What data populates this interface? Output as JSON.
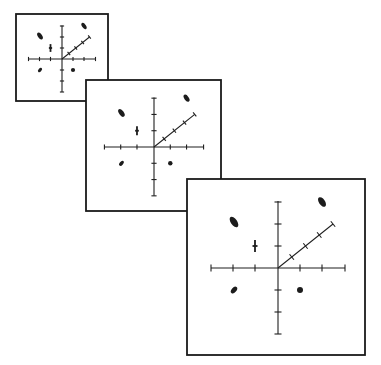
{
  "figure": {
    "colors": {
      "ink": "#1c1c1c",
      "background": "#ffffff",
      "panel_fill": "#ffffff"
    }
  },
  "panels": [
    {
      "name": "small",
      "frame": {
        "x": 16,
        "y": 14,
        "w": 92,
        "h": 87
      },
      "origin": {
        "x": 62,
        "y": 59
      },
      "scale": 0.5,
      "label": "Small panel"
    },
    {
      "name": "medium",
      "frame": {
        "x": 86,
        "y": 80,
        "w": 135,
        "h": 131
      },
      "origin": {
        "x": 154,
        "y": 147
      },
      "scale": 0.74,
      "label": "Medium panel"
    },
    {
      "name": "large",
      "frame": {
        "x": 187,
        "y": 179,
        "w": 178,
        "h": 176
      },
      "origin": {
        "x": 278,
        "y": 268
      },
      "scale": 1.0,
      "label": "Large panel"
    }
  ],
  "axes_template": {
    "horizontal": {
      "min": -67,
      "max": 67,
      "ticks": [
        -67,
        -45,
        -23,
        22,
        44,
        67
      ]
    },
    "vertical": {
      "min": -67,
      "max": 66,
      "ticks": [
        -66,
        -44,
        -22,
        22,
        44,
        66
      ]
    },
    "diagonal": {
      "end": {
        "x": 55,
        "y": -44
      },
      "ticks": [
        0.25,
        0.5,
        0.75,
        1.0
      ]
    },
    "tick_half_length": 3.5
  },
  "markers_template": [
    {
      "type": "ellipse",
      "name": "upper-left-ellipse",
      "cx": -44,
      "cy": -46,
      "rx": 3.2,
      "ry": 6,
      "rotate": -35
    },
    {
      "type": "ellipse",
      "name": "upper-right-ellipse",
      "cx": 44,
      "cy": -66,
      "rx": 3,
      "ry": 5.5,
      "rotate": -35
    },
    {
      "type": "cross",
      "name": "vertical-cross-marker",
      "cx": -23,
      "cy": -22,
      "half_h": 6,
      "half_w": 2.5
    },
    {
      "type": "ellipse",
      "name": "lower-left-ellipse",
      "cx": -44,
      "cy": 22,
      "rx": 2.4,
      "ry": 4,
      "rotate": 40
    },
    {
      "type": "dot",
      "name": "lower-right-dot",
      "cx": 22,
      "cy": 22,
      "r": 3
    }
  ]
}
